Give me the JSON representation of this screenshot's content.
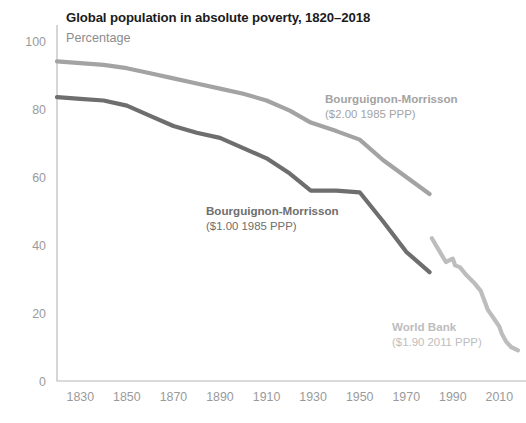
{
  "header": {
    "title": "Global population in absolute poverty, 1820–2018",
    "subtitle": "Percentage"
  },
  "colors": {
    "title": "#1b1b1b",
    "subtitle": "#8c8c8c",
    "tick": "#9a9a9a",
    "axis": "#b5b5b5",
    "series_dark": "#6e6e6e",
    "series_mid": "#a3a3a3",
    "series_light": "#bdbdbd",
    "background": "#ffffff"
  },
  "chart_data": {
    "type": "line",
    "title": "Global population in absolute poverty, 1820–2018",
    "subtitle": "Percentage",
    "xlabel": "",
    "ylabel": "Percentage",
    "xlim": [
      1820,
      2018
    ],
    "ylim": [
      0,
      100
    ],
    "xticks": [
      1830,
      1850,
      1870,
      1890,
      1910,
      1930,
      1950,
      1970,
      1990,
      2010
    ],
    "yticks": [
      0,
      20,
      40,
      60,
      80,
      100
    ],
    "grid": false,
    "legend": "inline-annotations",
    "series": [
      {
        "name": "Bourguignon-Morrisson ($2.00 1985 PPP)",
        "label_title": "Bourguignon-Morrisson",
        "label_sub": "($2.00 1985 PPP)",
        "color": "#a3a3a3",
        "x": [
          1820,
          1830,
          1840,
          1850,
          1860,
          1870,
          1880,
          1890,
          1900,
          1910,
          1920,
          1929,
          1940,
          1950,
          1960,
          1970,
          1980
        ],
        "y": [
          94,
          93.5,
          93,
          92,
          90.5,
          89,
          87.5,
          86,
          84.5,
          82.5,
          79.5,
          76,
          73.5,
          71,
          65,
          60,
          55
        ]
      },
      {
        "name": "Bourguignon-Morrisson ($1.00 1985 PPP)",
        "label_title": "Bourguignon-Morrisson",
        "label_sub": "($1.00 1985 PPP)",
        "color": "#6e6e6e",
        "x": [
          1820,
          1830,
          1840,
          1850,
          1860,
          1870,
          1880,
          1890,
          1900,
          1910,
          1920,
          1929,
          1940,
          1950,
          1960,
          1970,
          1980
        ],
        "y": [
          83.5,
          83,
          82.5,
          81,
          78,
          75,
          73,
          71.5,
          68.5,
          65.5,
          61,
          56,
          56,
          55.5,
          47,
          38,
          32
        ]
      },
      {
        "name": "World Bank ($1.90 2011 PPP)",
        "label_title": "World Bank",
        "label_sub": "($1.90 2011 PPP)",
        "color": "#bdbdbd",
        "x": [
          1981,
          1984,
          1987,
          1990,
          1991,
          1993,
          1996,
          1999,
          2002,
          2005,
          2008,
          2010,
          2011,
          2013,
          2015,
          2018
        ],
        "y": [
          42,
          38.5,
          35,
          36,
          34,
          33.5,
          31,
          29,
          26.5,
          21,
          18,
          16,
          14,
          11.5,
          10,
          9
        ]
      }
    ],
    "annotations": [
      {
        "name": "bourguignon-2dollar-label",
        "title": "Bourguignon-Morrisson",
        "sub": "($2.00 1985 PPP)",
        "color": "#a3a3a3",
        "x": 325,
        "y": 103
      },
      {
        "name": "bourguignon-1dollar-label",
        "title": "Bourguignon-Morrisson",
        "sub": "($1.00 1985 PPP)",
        "color": "#6e6e6e",
        "x": 206,
        "y": 215
      },
      {
        "name": "world-bank-label",
        "title": "World Bank",
        "sub": "($1.90 2011 PPP)",
        "color": "#bdbdbd",
        "x": 392,
        "y": 331
      }
    ]
  },
  "geometry": {
    "plot_left": 57,
    "plot_right": 518,
    "plot_top": 41,
    "plot_bottom": 381
  }
}
